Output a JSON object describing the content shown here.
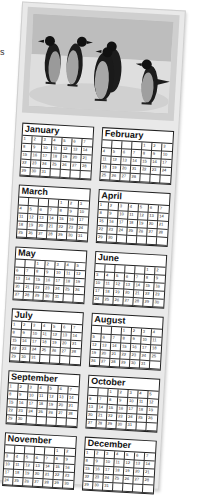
{
  "side_mark": "s",
  "photo": {
    "subject": "penguins-on-ice",
    "palette": {
      "sky": "#bdbdbd",
      "ice": "#e2e2e2",
      "penguin_back": "#1c1c1c",
      "penguin_belly": "#9a9a9a",
      "frame": "#cfcfcf"
    }
  },
  "calendar": {
    "months": [
      {
        "name": "January",
        "offset": 0,
        "days": 31
      },
      {
        "name": "February",
        "offset": 4,
        "days": 28
      },
      {
        "name": "March",
        "offset": 4,
        "days": 31
      },
      {
        "name": "April",
        "offset": 0,
        "days": 30
      },
      {
        "name": "May",
        "offset": 2,
        "days": 31
      },
      {
        "name": "June",
        "offset": 5,
        "days": 30
      },
      {
        "name": "July",
        "offset": 0,
        "days": 31
      },
      {
        "name": "August",
        "offset": 3,
        "days": 31
      },
      {
        "name": "September",
        "offset": 0,
        "days": 30
      },
      {
        "name": "October",
        "offset": 2,
        "days": 31
      },
      {
        "name": "November",
        "offset": 5,
        "days": 30
      },
      {
        "name": "December",
        "offset": 0,
        "days": 31
      }
    ]
  }
}
